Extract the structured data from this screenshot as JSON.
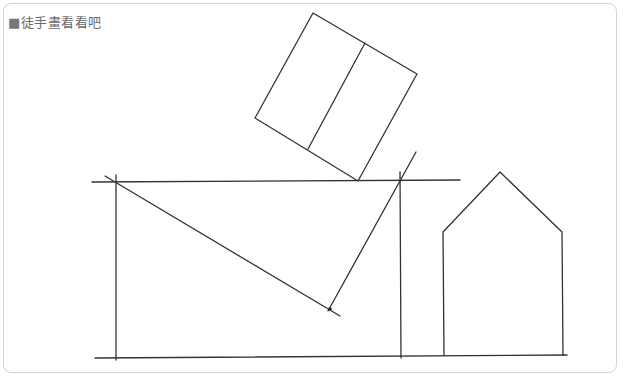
{
  "title": {
    "bullet": "■",
    "text": "徒手畫看看吧"
  },
  "colors": {
    "stroke": "#333333",
    "frame_border": "#d4d4d4",
    "title_text": "#6a6a6a",
    "background": "#ffffff"
  },
  "drawing": {
    "rotated_rectangle": {
      "top": [
        313,
        13
      ],
      "right": [
        417,
        74
      ],
      "bottom": [
        358,
        181
      ],
      "left": [
        255,
        118
      ]
    },
    "rotated_rectangle_divider": {
      "from": [
        365,
        43
      ],
      "to": [
        308,
        149
      ]
    },
    "top_horizontal_line": {
      "from": [
        92,
        182
      ],
      "to": [
        460,
        180
      ]
    },
    "bottom_horizontal_line": {
      "from": [
        95,
        358
      ],
      "to": [
        567,
        355
      ]
    },
    "left_vertical_line": {
      "from": [
        116,
        175
      ],
      "to": [
        116,
        360
      ]
    },
    "middle_vertical_line": {
      "from": [
        400,
        172
      ],
      "to": [
        401,
        358
      ]
    },
    "diagonal_down_line": {
      "from": [
        105,
        176
      ],
      "to": [
        340,
        316
      ]
    },
    "diagonal_up_line": {
      "from": [
        416,
        152
      ],
      "to": [
        328,
        311
      ]
    },
    "house": {
      "apex": [
        500,
        172
      ],
      "left_shoulder": [
        443,
        232
      ],
      "right_shoulder": [
        562,
        232
      ],
      "bottom_left": [
        444,
        355
      ],
      "bottom_right": [
        563,
        355
      ]
    }
  }
}
